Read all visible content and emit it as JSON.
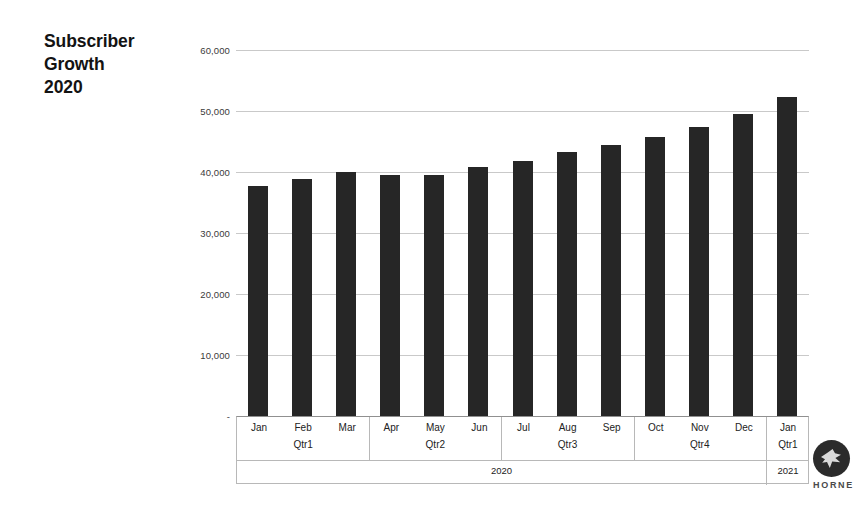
{
  "title": {
    "line1": "Subscriber",
    "line2": "Growth",
    "line3": "2020"
  },
  "logo": {
    "text": "HORNE",
    "icon": "hornet-logo-icon"
  },
  "chart_data": {
    "type": "bar",
    "title": "Subscriber Growth 2020",
    "xlabel": "",
    "ylabel": "",
    "ylim": [
      0,
      60000
    ],
    "grid": true,
    "legend": "none",
    "bar_color": "#262626",
    "categories": [
      "Jan",
      "Feb",
      "Mar",
      "Apr",
      "May",
      "Jun",
      "Jul",
      "Aug",
      "Sep",
      "Oct",
      "Nov",
      "Dec",
      "Jan"
    ],
    "values": [
      37700,
      38800,
      40000,
      39500,
      39500,
      40900,
      41800,
      43300,
      44400,
      45800,
      47300,
      49500,
      52300
    ],
    "ytick_labels": [
      "60,000",
      "50,000",
      "40,000",
      "30,000",
      "20,000",
      "10,000",
      "-"
    ],
    "ytick_values": [
      60000,
      50000,
      40000,
      30000,
      20000,
      10000,
      0
    ],
    "groups": {
      "quarters": [
        {
          "label": "Qtr1",
          "months": [
            "Jan",
            "Feb",
            "Mar"
          ]
        },
        {
          "label": "Qtr2",
          "months": [
            "Apr",
            "May",
            "Jun"
          ]
        },
        {
          "label": "Qtr3",
          "months": [
            "Jul",
            "Aug",
            "Sep"
          ]
        },
        {
          "label": "Qtr4",
          "months": [
            "Oct",
            "Nov",
            "Dec"
          ]
        },
        {
          "label": "Qtr1",
          "months": [
            "Jan"
          ]
        }
      ],
      "years": [
        {
          "label": "2020",
          "span": 12
        },
        {
          "label": "2021",
          "span": 1
        }
      ]
    }
  }
}
